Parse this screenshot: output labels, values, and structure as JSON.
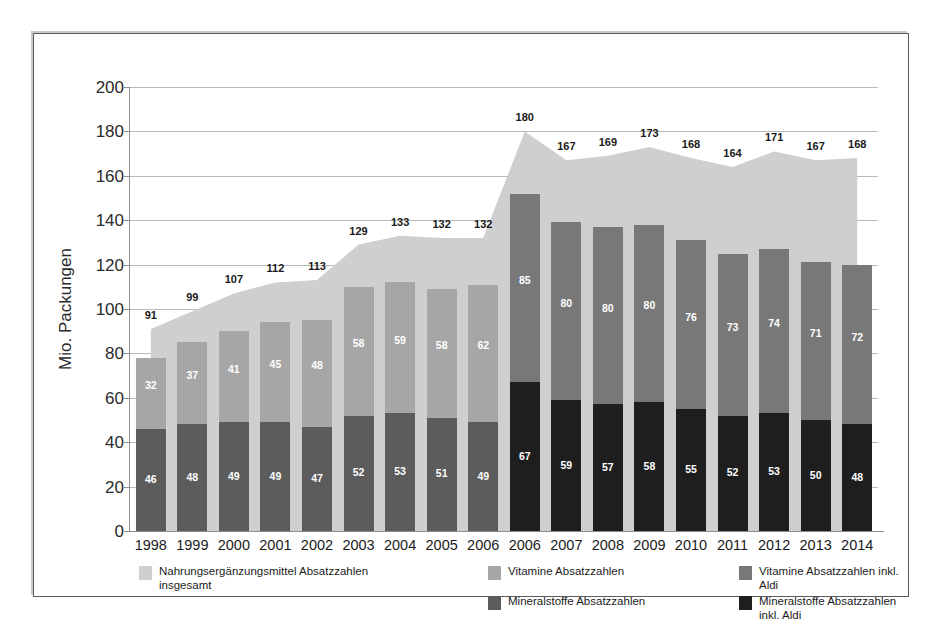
{
  "chart_data": {
    "type": "bar",
    "title": "",
    "subtitle": "",
    "xlabel": "",
    "ylabel": "Mio. Packungen",
    "ylim": [
      0,
      200
    ],
    "yticks": [
      0,
      20,
      40,
      60,
      80,
      100,
      120,
      140,
      160,
      180,
      200
    ],
    "grid": true,
    "legend_position": "bottom",
    "categories": [
      "1998",
      "1999",
      "2000",
      "2001",
      "2002",
      "2003",
      "2004",
      "2005",
      "2006",
      "2006",
      "2007",
      "2008",
      "2009",
      "2010",
      "2011",
      "2012",
      "2013",
      "2014"
    ],
    "series": [
      {
        "name": "Mineralstoffe Absatzzahlen",
        "color": "#5c5c5c",
        "values": [
          46,
          48,
          49,
          49,
          47,
          52,
          53,
          51,
          49,
          null,
          null,
          null,
          null,
          null,
          null,
          null,
          null,
          null
        ]
      },
      {
        "name": "Vitamine Absatzzahlen",
        "color": "#a6a6a6",
        "values": [
          32,
          37,
          41,
          45,
          48,
          58,
          59,
          58,
          62,
          null,
          null,
          null,
          null,
          null,
          null,
          null,
          null,
          null
        ]
      },
      {
        "name": "Mineralstoffe Absatzzahlen inkl. Aldi",
        "color": "#1e1e1e",
        "values": [
          null,
          null,
          null,
          null,
          null,
          null,
          null,
          null,
          null,
          67,
          59,
          57,
          58,
          55,
          52,
          53,
          50,
          48
        ]
      },
      {
        "name": "Vitamine Absatzzahlen inkl. Aldi",
        "color": "#787878",
        "values": [
          null,
          null,
          null,
          null,
          null,
          null,
          null,
          null,
          null,
          85,
          80,
          80,
          80,
          76,
          73,
          74,
          71,
          72
        ]
      },
      {
        "name": "Nahrungsergänzungsmittel Absatzzahlen insgesamt",
        "color": "#cfcfcf",
        "type": "area",
        "values": [
          91,
          99,
          107,
          112,
          113,
          129,
          133,
          132,
          132,
          180,
          167,
          169,
          173,
          168,
          164,
          171,
          167,
          168
        ]
      }
    ],
    "total_labels": [
      91,
      99,
      107,
      112,
      113,
      129,
      133,
      132,
      132,
      180,
      167,
      169,
      173,
      168,
      164,
      171,
      167,
      168
    ]
  },
  "axis": {
    "y_label": "Mio. Packungen",
    "y_ticks": [
      "200",
      "180",
      "160",
      "140",
      "120",
      "100",
      "80",
      "60",
      "40",
      "20",
      "0"
    ],
    "x_ticks": [
      "1998",
      "1999",
      "2000",
      "2001",
      "2002",
      "2003",
      "2004",
      "2005",
      "2006",
      "2006",
      "2007",
      "2008",
      "2009",
      "2010",
      "2011",
      "2012",
      "2013",
      "2014"
    ]
  },
  "legend": {
    "items": [
      {
        "label": "Nahrungsergänzungsmittel Absatzzahlen insgesamt",
        "color": "#cfcfcf"
      },
      {
        "label": "Vitamine Absatzzahlen",
        "color": "#a6a6a6"
      },
      {
        "label": "Vitamine Absatzzahlen inkl. Aldi",
        "color": "#787878"
      },
      {
        "label": "Mineralstoffe Absatzzahlen",
        "color": "#5c5c5c"
      },
      {
        "label": "Mineralstoffe Absatzzahlen inkl. Aldi",
        "color": "#1e1e1e"
      }
    ]
  },
  "colors": {
    "area": "#cfcfcf",
    "vitamins": "#a6a6a6",
    "vitamins_aldi": "#787878",
    "minerals": "#5c5c5c",
    "minerals_aldi": "#1e1e1e",
    "grid": "#b9b9b9",
    "axis": "#8d8d8d",
    "text": "#1a1a1a",
    "background": "#ffffff"
  }
}
